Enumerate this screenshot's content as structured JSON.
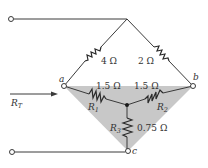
{
  "diagram": {
    "type": "circuit-delta-wye",
    "colors": {
      "wire": "#3a3a3a",
      "shade": "#c8c8c8",
      "text": "#333333"
    },
    "nodes": {
      "a": {
        "label": "a"
      },
      "b": {
        "label": "b"
      },
      "c": {
        "label": "c"
      }
    },
    "resistors": {
      "top_left": {
        "value": "4 Ω"
      },
      "top_right": {
        "value": "2 Ω"
      },
      "r1": {
        "name": "R",
        "sub": "1",
        "value": "1.5 Ω"
      },
      "r2": {
        "name": "R",
        "sub": "2",
        "value": "1.5 Ω"
      },
      "r3": {
        "name": "R",
        "sub": "3",
        "value": "0.75 Ω"
      }
    },
    "total": {
      "name": "R",
      "sub": "T"
    }
  }
}
